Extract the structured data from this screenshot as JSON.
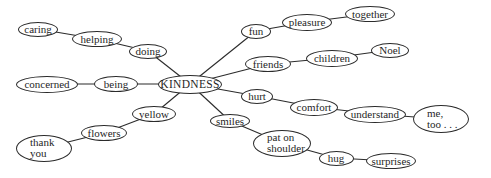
{
  "diagram": {
    "type": "mind-map",
    "central": "KINDNESS",
    "stroke_color": "#2b2b2b",
    "background": "#ffffff",
    "nodes": [
      {
        "id": "kindness",
        "label": "KINDNESS",
        "cx": 190,
        "cy": 84,
        "w": 64,
        "h": 19,
        "center": true
      },
      {
        "id": "caring",
        "label": "caring",
        "cx": 38,
        "cy": 29,
        "w": 40,
        "h": 15
      },
      {
        "id": "helping",
        "label": "helping",
        "cx": 97,
        "cy": 39,
        "w": 50,
        "h": 16
      },
      {
        "id": "doing",
        "label": "doing",
        "cx": 148,
        "cy": 51,
        "w": 38,
        "h": 15
      },
      {
        "id": "concerned",
        "label": "concerned",
        "cx": 47,
        "cy": 84,
        "w": 62,
        "h": 17
      },
      {
        "id": "being",
        "label": "being",
        "cx": 116,
        "cy": 84,
        "w": 44,
        "h": 16
      },
      {
        "id": "yellow",
        "label": "yellow",
        "cx": 154,
        "cy": 114,
        "w": 44,
        "h": 16
      },
      {
        "id": "flowers",
        "label": "flowers",
        "cx": 104,
        "cy": 133,
        "w": 46,
        "h": 16
      },
      {
        "id": "thank-you",
        "label": "thank\nyou",
        "cx": 44,
        "cy": 148,
        "w": 56,
        "h": 27,
        "multi": true
      },
      {
        "id": "smiles",
        "label": "smiles",
        "cx": 230,
        "cy": 121,
        "w": 40,
        "h": 14
      },
      {
        "id": "fun",
        "label": "fun",
        "cx": 256,
        "cy": 31,
        "w": 30,
        "h": 15
      },
      {
        "id": "pleasure",
        "label": "pleasure",
        "cx": 307,
        "cy": 22,
        "w": 50,
        "h": 17
      },
      {
        "id": "together",
        "label": "together",
        "cx": 370,
        "cy": 14,
        "w": 50,
        "h": 16
      },
      {
        "id": "friends",
        "label": "friends",
        "cx": 268,
        "cy": 64,
        "w": 46,
        "h": 16
      },
      {
        "id": "children",
        "label": "children",
        "cx": 332,
        "cy": 58,
        "w": 52,
        "h": 17
      },
      {
        "id": "noel",
        "label": "Noel",
        "cx": 390,
        "cy": 50,
        "w": 38,
        "h": 15
      },
      {
        "id": "hurt",
        "label": "hurt",
        "cx": 257,
        "cy": 96,
        "w": 32,
        "h": 15
      },
      {
        "id": "comfort",
        "label": "comfort",
        "cx": 314,
        "cy": 107,
        "w": 48,
        "h": 17
      },
      {
        "id": "understand",
        "label": "understand",
        "cx": 375,
        "cy": 114,
        "w": 62,
        "h": 17
      },
      {
        "id": "me-too",
        "label": "me,\ntoo . . .",
        "cx": 441,
        "cy": 119,
        "w": 56,
        "h": 28,
        "multi": true
      },
      {
        "id": "pat-on-shoulder",
        "label": "pat on\nshoulder",
        "cx": 282,
        "cy": 143,
        "w": 58,
        "h": 27,
        "multi": true
      },
      {
        "id": "hug",
        "label": "hug",
        "cx": 336,
        "cy": 158,
        "w": 35,
        "h": 15
      },
      {
        "id": "surprises",
        "label": "surprises",
        "cx": 391,
        "cy": 161,
        "w": 50,
        "h": 16
      }
    ],
    "edges": [
      [
        "caring",
        "helping"
      ],
      [
        "helping",
        "doing"
      ],
      [
        "doing",
        "kindness"
      ],
      [
        "concerned",
        "being"
      ],
      [
        "being",
        "kindness"
      ],
      [
        "kindness",
        "yellow"
      ],
      [
        "yellow",
        "flowers"
      ],
      [
        "flowers",
        "thank-you"
      ],
      [
        "kindness",
        "smiles"
      ],
      [
        "kindness",
        "fun"
      ],
      [
        "fun",
        "pleasure"
      ],
      [
        "pleasure",
        "together"
      ],
      [
        "kindness",
        "friends"
      ],
      [
        "friends",
        "children"
      ],
      [
        "children",
        "noel"
      ],
      [
        "kindness",
        "hurt"
      ],
      [
        "hurt",
        "comfort"
      ],
      [
        "comfort",
        "understand"
      ],
      [
        "understand",
        "me-too"
      ],
      [
        "smiles",
        "pat-on-shoulder"
      ],
      [
        "pat-on-shoulder",
        "hug"
      ],
      [
        "hug",
        "surprises"
      ]
    ]
  }
}
